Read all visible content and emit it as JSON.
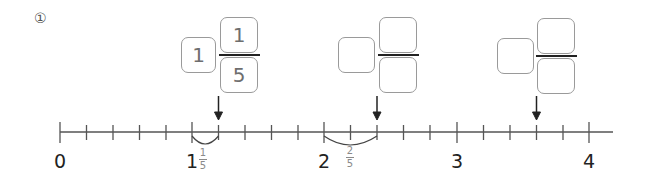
{
  "problem": {
    "number": "①"
  },
  "number_line": {
    "labels": [
      "0",
      "1",
      "2",
      "3",
      "4"
    ],
    "divisions_per_unit": 5,
    "hint_1": {
      "whole": "1",
      "numerator": "1",
      "denominator": "5"
    },
    "hint_2": {
      "numerator": "2",
      "denominator": "5"
    }
  },
  "answers": [
    {
      "whole": "1",
      "numerator": "1",
      "denominator": "5"
    },
    {
      "whole": "",
      "numerator": "",
      "denominator": ""
    },
    {
      "whole": "",
      "numerator": "",
      "denominator": ""
    }
  ],
  "colors": {
    "line": "#555555",
    "tick": "#555555",
    "box_border": "#9a9a9a",
    "hint_text": "#8a8a8a"
  }
}
